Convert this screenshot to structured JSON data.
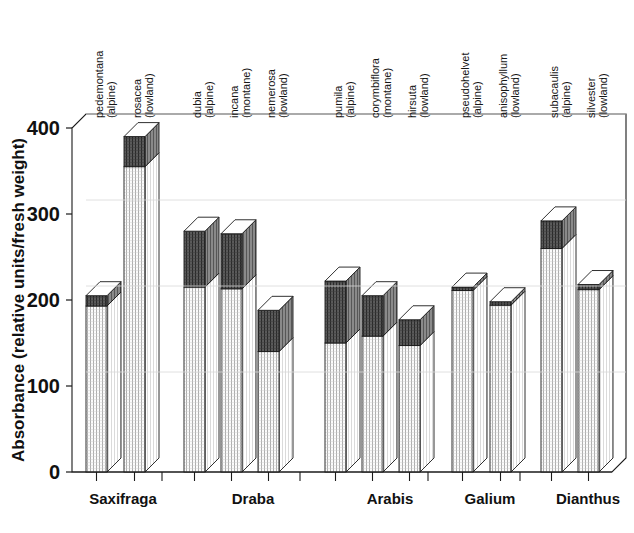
{
  "chart_data": {
    "type": "bar",
    "subtype": "stacked-3d-column",
    "title": "",
    "xlabel": "",
    "ylabel": "Absorbance (relative units/fresh weight)",
    "ylim": [
      0,
      400
    ],
    "yticks": [
      0,
      100,
      200,
      300,
      400
    ],
    "grid": false,
    "legend": null,
    "series": [
      {
        "name": "lower-segment",
        "fill": "light-vertical-hatch",
        "values": [
          193,
          355,
          215,
          213,
          140,
          150,
          158,
          147,
          211,
          194,
          260,
          212
        ]
      },
      {
        "name": "upper-segment",
        "fill": "dark-stipple",
        "values": [
          12,
          35,
          65,
          64,
          48,
          72,
          47,
          30,
          4,
          4,
          32,
          6
        ]
      }
    ],
    "totals": [
      205,
      390,
      280,
      277,
      188,
      222,
      205,
      177,
      215,
      198,
      292,
      218
    ],
    "groups": [
      {
        "genus": "Saxifraga",
        "species": [
          {
            "name": "pedemontana",
            "habitat": "(alpine)",
            "lower": 193,
            "upper": 12,
            "total": 205
          },
          {
            "name": "rosacea",
            "habitat": "(lowland)",
            "lower": 355,
            "upper": 35,
            "total": 390
          }
        ]
      },
      {
        "genus": "Draba",
        "species": [
          {
            "name": "dubia",
            "habitat": "(alpine)",
            "lower": 215,
            "upper": 65,
            "total": 280
          },
          {
            "name": "incana",
            "habitat": "(montane)",
            "lower": 213,
            "upper": 64,
            "total": 277
          },
          {
            "name": "nemerosa",
            "habitat": "(lowland)",
            "lower": 140,
            "upper": 48,
            "total": 188
          }
        ]
      },
      {
        "genus": "Arabis",
        "species": [
          {
            "name": "pumila",
            "habitat": "(alpine)",
            "lower": 150,
            "upper": 72,
            "total": 222
          },
          {
            "name": "corymbiflora",
            "habitat": "(montane)",
            "lower": 158,
            "upper": 47,
            "total": 205
          },
          {
            "name": "hirsuta",
            "habitat": "(lowland)",
            "lower": 147,
            "upper": 30,
            "total": 177
          }
        ]
      },
      {
        "genus": "Galium",
        "species": [
          {
            "name": "pseudohelvet",
            "habitat": "(alpine)",
            "lower": 211,
            "upper": 4,
            "total": 215
          },
          {
            "name": "anisophyllum",
            "habitat": "(lowland)",
            "lower": 194,
            "upper": 4,
            "total": 198
          }
        ]
      },
      {
        "genus": "Dianthus",
        "species": [
          {
            "name": "subacaulis",
            "habitat": "(alpine)",
            "lower": 260,
            "upper": 32,
            "total": 292
          },
          {
            "name": "silvester",
            "habitat": "(lowland)",
            "lower": 212,
            "upper": 6,
            "total": 218
          }
        ]
      }
    ]
  },
  "colors": {
    "axis": "#1a1a1a",
    "bar_outline": "#1a1a1a",
    "lower_segment": "#f2f2f2",
    "upper_segment": "#545454",
    "top_face": "#ffffff",
    "side_face": "#ffffff",
    "background": "#ffffff"
  },
  "axis": {
    "y_title": "Absorbance (relative units/fresh weight)",
    "y_ticks": [
      "400",
      "300",
      "200",
      "100",
      "0"
    ]
  }
}
